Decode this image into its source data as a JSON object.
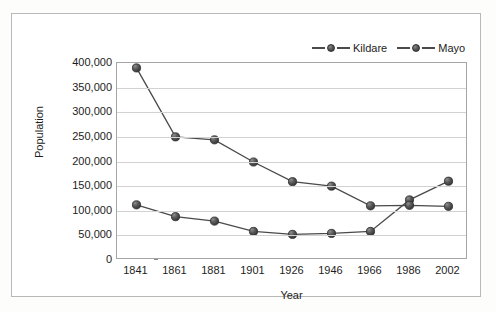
{
  "chart_data": {
    "type": "line",
    "title": "",
    "xlabel": "Year",
    "ylabel": "Population",
    "categories": [
      "1841",
      "1861",
      "1881",
      "1901",
      "1926",
      "1946",
      "1966",
      "1986",
      "2002"
    ],
    "ylim": [
      0,
      400000
    ],
    "ytick_labels": [
      "400,000",
      "350,000",
      "300,000",
      "250,000",
      "200,000",
      "150,000",
      "100,000",
      "50,000",
      "0"
    ],
    "ytick_values": [
      400000,
      350000,
      300000,
      250000,
      200000,
      150000,
      100000,
      50000,
      0
    ],
    "grid": true,
    "legend_position": "top-right",
    "series": [
      {
        "name": "Kildare",
        "color": "#4a4a4a",
        "values": [
          112000,
          88000,
          79000,
          58000,
          52000,
          54000,
          58000,
          122000,
          160000
        ]
      },
      {
        "name": "Mayo",
        "color": "#4a4a4a",
        "values": [
          390000,
          250000,
          244000,
          199000,
          159000,
          150000,
          110000,
          111000,
          109000
        ]
      }
    ]
  },
  "legend": {
    "entries": [
      {
        "label": "Kildare"
      },
      {
        "label": "Mayo"
      }
    ]
  },
  "axes": {
    "y_title": "Population",
    "x_title": "Year"
  },
  "colors": {
    "series_line": "#4a4a4a",
    "marker_fill": "#585858",
    "gridline": "#d2d2d2",
    "plot_border": "#a6a6a6",
    "frame_border": "#b9b9b9",
    "text": "#1d1d1d"
  }
}
